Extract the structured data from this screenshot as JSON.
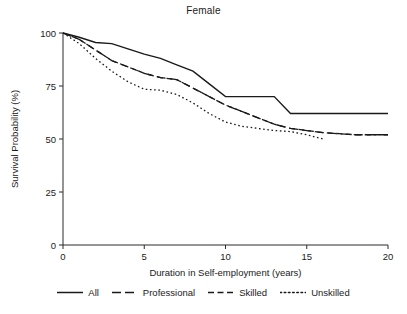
{
  "chart_data": {
    "type": "line",
    "title": "Female",
    "xlabel": "Duration in Self-employment (years)",
    "ylabel": "Survival Probability (%)",
    "xlim": [
      0,
      20
    ],
    "ylim": [
      0,
      100
    ],
    "xticks": [
      0,
      5,
      10,
      15,
      20
    ],
    "yticks": [
      0,
      25,
      50,
      75,
      100
    ],
    "grid": false,
    "legend_position": "bottom",
    "series": [
      {
        "name": "All",
        "style": "solid",
        "x": [
          0,
          1,
          2,
          3,
          4,
          5,
          6,
          7,
          8,
          9,
          10,
          11,
          12,
          13,
          14,
          15,
          16,
          17,
          18,
          19,
          20
        ],
        "values": [
          100,
          98,
          95.5,
          95,
          92.5,
          90,
          88,
          85,
          82,
          76,
          70,
          70,
          70,
          70,
          62,
          62,
          62,
          62,
          62,
          62,
          62
        ]
      },
      {
        "name": "Professional",
        "style": "long-dash",
        "x": [
          0,
          1,
          2,
          3,
          4,
          5,
          6,
          7,
          8,
          9,
          10,
          11,
          12,
          13,
          14,
          15,
          16,
          17,
          18,
          19,
          20
        ],
        "values": [
          100,
          97,
          92,
          87,
          84,
          81,
          79,
          78,
          74,
          70,
          66,
          63,
          60,
          57,
          55,
          54,
          53,
          52.5,
          52,
          52,
          52
        ]
      },
      {
        "name": "Skilled",
        "style": "dash",
        "x": [
          0,
          1,
          2,
          3,
          4,
          5,
          6,
          7,
          8,
          9,
          10,
          11,
          12,
          13,
          14,
          15,
          16,
          17,
          18,
          19,
          20
        ],
        "values": [
          100,
          97,
          92,
          87,
          84,
          81,
          79,
          78,
          74,
          70,
          66,
          63,
          60,
          57,
          55,
          54,
          53,
          52.5,
          52,
          52,
          52
        ]
      },
      {
        "name": "Unskilled",
        "style": "dotted",
        "x": [
          0,
          1,
          2,
          3,
          4,
          5,
          6,
          7,
          8,
          9,
          10,
          11,
          12,
          13,
          14,
          15,
          16
        ],
        "values": [
          100,
          95,
          88,
          82,
          77,
          73.5,
          73,
          71,
          67,
          62,
          58,
          56,
          55,
          54,
          53.5,
          52,
          50
        ]
      }
    ]
  },
  "legend": {
    "items": [
      {
        "label": "All",
        "style": "solid"
      },
      {
        "label": "Professional",
        "style": "long-dash"
      },
      {
        "label": "Skilled",
        "style": "dash"
      },
      {
        "label": "Unskilled",
        "style": "dotted"
      }
    ]
  }
}
